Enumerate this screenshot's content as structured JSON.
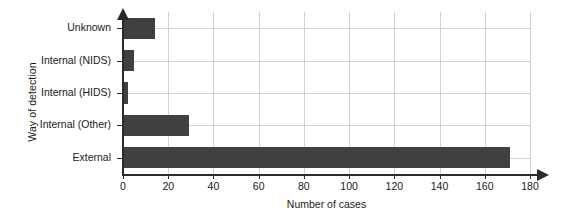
{
  "chart_data": {
    "type": "bar",
    "orientation": "horizontal",
    "title": "",
    "xlabel": "Number of cases",
    "ylabel": "Way of detection",
    "categories": [
      "External",
      "Internal (Other)",
      "Internal (HIDS)",
      "Internal (NIDS)",
      "Unknown"
    ],
    "values": [
      171,
      29,
      2,
      5,
      14
    ],
    "xlim": [
      0,
      180
    ],
    "xticks": [
      0,
      20,
      40,
      60,
      80,
      100,
      120,
      140,
      160,
      180
    ],
    "xticklabels": [
      "0",
      "20",
      "40",
      "60",
      "80",
      "100",
      "120",
      "140",
      "160",
      "180"
    ],
    "grid": true,
    "legend": null,
    "bar_color": "#404040",
    "grid_color": "#d2d2d2",
    "axis_color": "#2b2b2b"
  }
}
